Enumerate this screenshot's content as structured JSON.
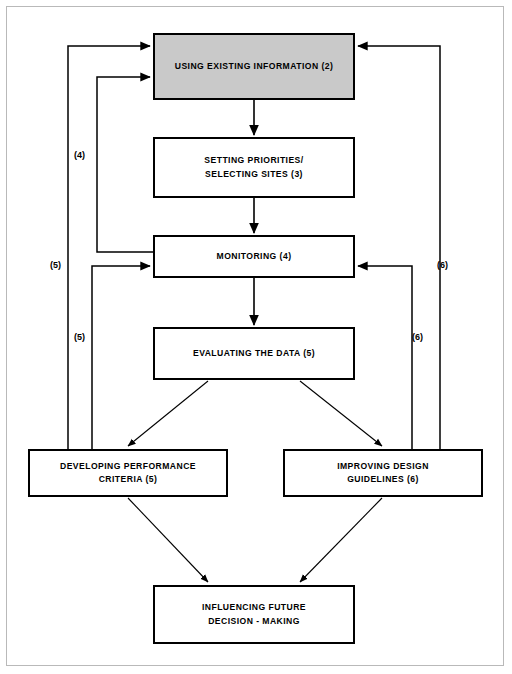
{
  "diagram": {
    "nodes": [
      {
        "id": "using-existing-information",
        "label": "USING EXISTING INFORMATION (2)",
        "step": "2",
        "shaded": true,
        "fill": "#c9c9c9",
        "x": 153,
        "y": 33,
        "w": 202,
        "h": 67
      },
      {
        "id": "setting-priorities",
        "label": "SETTING PRIORITIES/\nSELECTING SITES (3)",
        "step": "3",
        "shaded": false,
        "fill": "#ffffff",
        "x": 153,
        "y": 137,
        "w": 202,
        "h": 61
      },
      {
        "id": "monitoring",
        "label": "MONITORING (4)",
        "step": "4",
        "shaded": false,
        "fill": "#ffffff",
        "x": 153,
        "y": 235,
        "w": 202,
        "h": 43
      },
      {
        "id": "evaluating-the-data",
        "label": "EVALUATING THE DATA (5)",
        "step": "5",
        "shaded": false,
        "fill": "#ffffff",
        "x": 153,
        "y": 327,
        "w": 202,
        "h": 53
      },
      {
        "id": "developing-performance-criteria",
        "label": "DEVELOPING PERFORMANCE\nCRITERIA (5)",
        "step": "5",
        "shaded": false,
        "fill": "#ffffff",
        "x": 28,
        "y": 449,
        "w": 200,
        "h": 48
      },
      {
        "id": "improving-design-guidelines",
        "label": "IMPROVING DESIGN\nGUIDELINES (6)",
        "step": "6",
        "shaded": false,
        "fill": "#ffffff",
        "x": 283,
        "y": 449,
        "w": 200,
        "h": 48
      },
      {
        "id": "influencing-future-decision-making",
        "label": "INFLUENCING FUTURE\nDECISION - MAKING",
        "step": "",
        "shaded": false,
        "fill": "#ffffff",
        "x": 153,
        "y": 585,
        "w": 202,
        "h": 59
      }
    ],
    "edges": [
      {
        "id": "e-using-to-setting",
        "from": "using-existing-information",
        "to": "setting-priorities",
        "label": "",
        "kind": "straight-down"
      },
      {
        "id": "e-setting-to-monitoring",
        "from": "setting-priorities",
        "to": "monitoring",
        "label": "",
        "kind": "straight-down"
      },
      {
        "id": "e-monitoring-to-evaluating",
        "from": "monitoring",
        "to": "evaluating-the-data",
        "label": "",
        "kind": "straight-down"
      },
      {
        "id": "e-evaluating-to-developing",
        "from": "evaluating-the-data",
        "to": "developing-performance-criteria",
        "label": "",
        "kind": "diagonal"
      },
      {
        "id": "e-evaluating-to-improving",
        "from": "evaluating-the-data",
        "to": "improving-design-guidelines",
        "label": "",
        "kind": "diagonal"
      },
      {
        "id": "e-developing-to-influencing",
        "from": "developing-performance-criteria",
        "to": "influencing-future-decision-making",
        "label": "",
        "kind": "diagonal"
      },
      {
        "id": "e-improving-to-influencing",
        "from": "improving-design-guidelines",
        "to": "influencing-future-decision-making",
        "label": "",
        "kind": "diagonal"
      },
      {
        "id": "e-monitoring-to-using",
        "from": "monitoring",
        "to": "using-existing-information",
        "label": "(4)",
        "kind": "feedback-left"
      },
      {
        "id": "e-developing-to-using",
        "from": "developing-performance-criteria",
        "to": "using-existing-information",
        "label": "(5)",
        "kind": "feedback-left"
      },
      {
        "id": "e-developing-to-monitoring",
        "from": "developing-performance-criteria",
        "to": "monitoring",
        "label": "(5)",
        "kind": "feedback-left"
      },
      {
        "id": "e-improving-to-using",
        "from": "improving-design-guidelines",
        "to": "using-existing-information",
        "label": "(6)",
        "kind": "feedback-right"
      },
      {
        "id": "e-improving-to-monitoring",
        "from": "improving-design-guidelines",
        "to": "monitoring",
        "label": "(6)",
        "kind": "feedback-right"
      }
    ],
    "edge_labels": [
      {
        "id": "label-4",
        "text": "(4)",
        "x": 74,
        "y": 150
      },
      {
        "id": "label-5-outer",
        "text": "(5)",
        "x": 50,
        "y": 260
      },
      {
        "id": "label-5-inner",
        "text": "(5)",
        "x": 74,
        "y": 332
      },
      {
        "id": "label-6-outer",
        "text": "(6)",
        "x": 437,
        "y": 260
      },
      {
        "id": "label-6-inner",
        "text": "(6)",
        "x": 412,
        "y": 332
      }
    ]
  }
}
